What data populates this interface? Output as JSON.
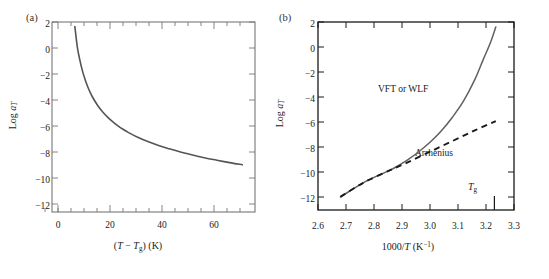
{
  "figure": {
    "panels": [
      {
        "id": "a",
        "label": "(a)",
        "xlabel_plain": "(T − Tg) (K)",
        "ylabel_plain": "Log aT"
      },
      {
        "id": "b",
        "label": "(b)",
        "xlabel_plain": "1000/T (K⁻¹)",
        "ylabel_plain": "Log aT",
        "annotations": {
          "vft": "VFT or WLF",
          "arrhenius": "Arrhenius",
          "tg": "Tg"
        }
      }
    ],
    "colors": {
      "curve_a": "#555555",
      "curve_vft": "#606060",
      "curve_arrhenius": "#1a1a1a",
      "frame_a": "#777777",
      "frame_b": "#1a1a1a",
      "text": "#1a1a1a"
    }
  },
  "chart_data": [
    {
      "type": "line",
      "panel": "a",
      "title": "",
      "xlabel": "(T − Tg) (K)",
      "ylabel": "Log aT",
      "xlim": [
        -10,
        70
      ],
      "ylim": [
        -13,
        2
      ],
      "xticks": [
        0,
        20,
        40,
        60
      ],
      "xtick_labels": [
        "0",
        "20",
        "40",
        "60"
      ],
      "xminor_step": 5,
      "yticks": [
        2,
        0,
        -2,
        -4,
        -6,
        -8,
        -10,
        -12
      ],
      "ytick_labels": [
        "2",
        "0",
        "−2",
        "−4",
        "−6",
        "−8",
        "−10",
        "−12"
      ],
      "grid": false,
      "legend": "none",
      "series": [
        {
          "name": "WLF shift factor",
          "style": "solid",
          "x": [
            -1,
            0,
            1,
            2,
            3,
            4,
            5,
            6,
            8,
            10,
            12,
            14,
            16,
            18,
            20,
            24,
            28,
            32,
            36,
            40,
            45,
            50,
            55,
            60,
            65
          ],
          "values": [
            1.65,
            0.0,
            -1.03,
            -1.86,
            -2.52,
            -3.07,
            -3.54,
            -3.94,
            -4.59,
            -5.11,
            -5.53,
            -5.89,
            -6.2,
            -6.47,
            -6.71,
            -7.12,
            -7.46,
            -7.75,
            -8.0,
            -8.23,
            -8.48,
            -8.71,
            -8.91,
            -9.1,
            -9.27
          ]
        }
      ]
    },
    {
      "type": "line",
      "panel": "b",
      "title": "",
      "xlabel": "1000/T (K⁻¹)",
      "ylabel": "Log aT",
      "xlim": [
        2.6,
        3.3
      ],
      "ylim": [
        -13,
        2
      ],
      "xticks": [
        2.6,
        2.7,
        2.8,
        2.9,
        3.0,
        3.1,
        3.2,
        3.3
      ],
      "xtick_labels": [
        "2.6",
        "2.7",
        "2.8",
        "2.9",
        "3.0",
        "3.1",
        "3.2",
        "3.3"
      ],
      "yticks": [
        2,
        0,
        -2,
        -4,
        -6,
        -8,
        -10,
        -12
      ],
      "ytick_labels": [
        "2",
        "0",
        "−2",
        "−4",
        "−6",
        "−8",
        "−10",
        "−12"
      ],
      "grid": false,
      "legend": "inline-annotations",
      "markers": [
        {
          "name": "Tg",
          "x": 3.23,
          "axis": "x"
        }
      ],
      "series": [
        {
          "name": "VFT or WLF",
          "style": "solid",
          "x": [
            2.68,
            2.72,
            2.76,
            2.8,
            2.84,
            2.86,
            2.88,
            2.92,
            2.96,
            3.0,
            3.04,
            3.08,
            3.12,
            3.16,
            3.19,
            3.215,
            3.235
          ],
          "values": [
            -11.95,
            -11.4,
            -10.85,
            -10.4,
            -10.0,
            -9.8,
            -9.55,
            -9.0,
            -8.35,
            -7.6,
            -6.7,
            -5.6,
            -4.3,
            -2.6,
            -1.0,
            0.3,
            1.6
          ]
        },
        {
          "name": "Arrhenius",
          "style": "dashed",
          "x": [
            2.68,
            2.76,
            2.84,
            2.86,
            2.92,
            3.0,
            3.08,
            3.16,
            3.235
          ],
          "values": [
            -11.95,
            -10.85,
            -10.0,
            -9.8,
            -9.2,
            -8.35,
            -7.5,
            -6.65,
            -5.9
          ]
        }
      ]
    }
  ]
}
